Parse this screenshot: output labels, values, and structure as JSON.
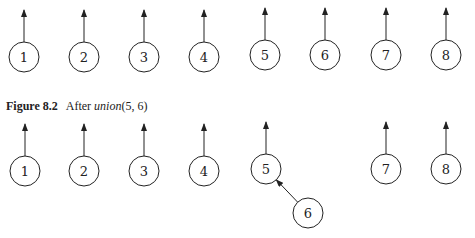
{
  "caption": {
    "figure_label": "Figure 8.2",
    "text_prefix": "After ",
    "function_name": "union",
    "args": "(5, 6)"
  },
  "colors": {
    "stroke": "#222222",
    "background": "#ffffff"
  },
  "rows": [
    {
      "name": "initial-forest",
      "nodes": [
        {
          "label": "1",
          "cx": 24,
          "cy": 57,
          "parent": null
        },
        {
          "label": "2",
          "cx": 84,
          "cy": 57,
          "parent": null
        },
        {
          "label": "3",
          "cx": 144,
          "cy": 57,
          "parent": null
        },
        {
          "label": "4",
          "cx": 204,
          "cy": 57,
          "parent": null
        },
        {
          "label": "5",
          "cx": 265,
          "cy": 55,
          "parent": null
        },
        {
          "label": "6",
          "cx": 325,
          "cy": 55,
          "parent": null
        },
        {
          "label": "7",
          "cx": 386,
          "cy": 55,
          "parent": null
        },
        {
          "label": "8",
          "cx": 446,
          "cy": 55,
          "parent": null
        }
      ]
    },
    {
      "name": "after-union-5-6",
      "nodes": [
        {
          "label": "1",
          "cx": 25,
          "cy": 171,
          "parent": null
        },
        {
          "label": "2",
          "cx": 84,
          "cy": 171,
          "parent": null
        },
        {
          "label": "3",
          "cx": 144,
          "cy": 171,
          "parent": null
        },
        {
          "label": "4",
          "cx": 204,
          "cy": 171,
          "parent": null
        },
        {
          "label": "5",
          "cx": 266,
          "cy": 169,
          "parent": null
        },
        {
          "label": "6",
          "cx": 308,
          "cy": 213,
          "parent": "5"
        },
        {
          "label": "7",
          "cx": 386,
          "cy": 169,
          "parent": null
        },
        {
          "label": "8",
          "cx": 446,
          "cy": 169,
          "parent": null
        }
      ]
    }
  ]
}
